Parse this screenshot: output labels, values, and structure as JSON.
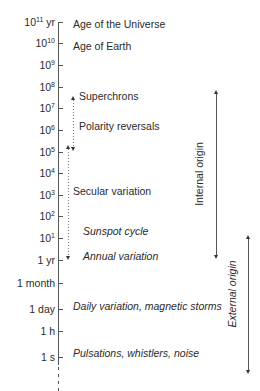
{
  "axis": {
    "ticks": [
      {
        "id": "t11",
        "base": "10",
        "exp": "11",
        "unit": " yr",
        "y": 22
      },
      {
        "id": "t10",
        "base": "10",
        "exp": "10",
        "unit": "",
        "y": 43
      },
      {
        "id": "t9",
        "base": "10",
        "exp": "9",
        "unit": "",
        "y": 65
      },
      {
        "id": "t8",
        "base": "10",
        "exp": "8",
        "unit": "",
        "y": 87
      },
      {
        "id": "t7",
        "base": "10",
        "exp": "7",
        "unit": "",
        "y": 108
      },
      {
        "id": "t6",
        "base": "10",
        "exp": "6",
        "unit": "",
        "y": 130
      },
      {
        "id": "t5",
        "base": "10",
        "exp": "5",
        "unit": "",
        "y": 152
      },
      {
        "id": "t4",
        "base": "10",
        "exp": "4",
        "unit": "",
        "y": 173
      },
      {
        "id": "t3",
        "base": "10",
        "exp": "3",
        "unit": "",
        "y": 195
      },
      {
        "id": "t2",
        "base": "10",
        "exp": "2",
        "unit": "",
        "y": 216
      },
      {
        "id": "t1",
        "base": "10",
        "exp": "1",
        "unit": "",
        "y": 238
      },
      {
        "id": "yr",
        "text": "1 yr",
        "y": 260
      },
      {
        "id": "month",
        "text": "1 month",
        "y": 283
      },
      {
        "id": "day",
        "text": "1 day",
        "y": 309
      },
      {
        "id": "hour",
        "text": "1 h",
        "y": 331
      },
      {
        "id": "sec",
        "text": "1 s",
        "y": 357
      }
    ]
  },
  "phenomena": [
    {
      "label": "Age of the Universe",
      "x": 73,
      "y": 24,
      "italic": false
    },
    {
      "label": "Age of Earth",
      "x": 73,
      "y": 46,
      "italic": false
    },
    {
      "label": "Superchrons",
      "x": 79,
      "y": 96,
      "italic": false
    },
    {
      "label": "Polarity reversals",
      "x": 79,
      "y": 126,
      "italic": false
    },
    {
      "label": "Secular variation",
      "x": 73,
      "y": 191,
      "italic": false
    },
    {
      "label": "Sunspot cycle",
      "x": 83,
      "y": 231,
      "italic": true
    },
    {
      "label": "Annual variation",
      "x": 83,
      "y": 256,
      "italic": true
    },
    {
      "label": "Daily variation, magnetic storms",
      "x": 73,
      "y": 306,
      "italic": true
    },
    {
      "label": "Pulsations, whistlers, noise",
      "x": 73,
      "y": 353,
      "italic": true
    }
  ],
  "ranges": {
    "internal": {
      "label": "Internal origin",
      "x": 216,
      "top": 92,
      "bottom": 258
    },
    "external": {
      "label": "External origin",
      "x": 248,
      "top": 237,
      "bottom": 373
    }
  },
  "chart_data": {
    "type": "table",
    "axis": "log time scale, 1 s to 10^11 yr",
    "tick_labels": [
      "10^11 yr",
      "10^10",
      "10^9",
      "10^8",
      "10^7",
      "10^6",
      "10^5",
      "10^4",
      "10^3",
      "10^2",
      "10^1",
      "1 yr",
      "1 month",
      "1 day",
      "1 h",
      "1 s"
    ],
    "entries": [
      {
        "label": "Age of the Universe",
        "timescale": "10^11 yr"
      },
      {
        "label": "Age of Earth",
        "timescale": "10^10 yr"
      },
      {
        "label": "Superchrons",
        "timescale": "~10^7 yr"
      },
      {
        "label": "Polarity reversals",
        "timescale": "10^5–10^7 yr"
      },
      {
        "label": "Secular variation",
        "timescale": "1–10^5 yr"
      },
      {
        "label": "Sunspot cycle",
        "timescale": "~10 yr"
      },
      {
        "label": "Annual variation",
        "timescale": "1 yr"
      },
      {
        "label": "Daily variation, magnetic storms",
        "timescale": "1 day"
      },
      {
        "label": "Pulsations, whistlers, noise",
        "timescale": "1 s"
      }
    ],
    "ranges": [
      {
        "label": "Internal origin",
        "from": "1 yr",
        "to": "~10^7 yr"
      },
      {
        "label": "External origin",
        "from": "<1 s",
        "to": "~10 yr"
      }
    ]
  }
}
